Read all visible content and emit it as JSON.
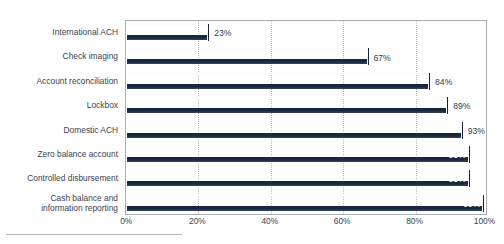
{
  "chart_data": {
    "type": "bar",
    "orientation": "horizontal",
    "title": "",
    "xlabel": "",
    "ylabel": "",
    "xlim": [
      0,
      100
    ],
    "grid": true,
    "legend": "none",
    "categories": [
      "International ACH",
      "Check imaging",
      "Account reconciliation",
      "Lockbox",
      "Domestic ACH",
      "Zero balance account",
      "Controlled disbursement",
      "Cash balance and\ninformation reporting"
    ],
    "values": [
      23,
      67,
      84,
      89,
      93,
      95,
      95,
      99
    ],
    "value_labels": [
      "23%",
      "67%",
      "84%",
      "89%",
      "93%",
      "95%",
      "95%",
      "99%"
    ],
    "label_placement": [
      "outside",
      "outside",
      "outside",
      "outside",
      "outside",
      "inside",
      "inside",
      "inside"
    ],
    "xticks": [
      0,
      20,
      40,
      60,
      80,
      100
    ],
    "xtick_labels": [
      "0%",
      "20%",
      "40%",
      "60%",
      "80%",
      "100%"
    ],
    "colors": {
      "bar_light": "#e6e8ea",
      "bar_mid": "#8e99a6",
      "bar_dark": "#16243a",
      "grid": "#b9bcc2",
      "axis": "#a9adb4",
      "text": "#3b434f",
      "label_inside": "#ffffff"
    }
  }
}
